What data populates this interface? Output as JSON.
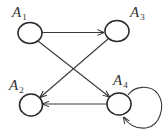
{
  "diagram": {
    "type": "directed-graph",
    "colors": {
      "stroke": "#2a2a2a",
      "background": "#ffffff"
    },
    "nodes": [
      {
        "id": "A1",
        "letter": "A",
        "sub": "1",
        "cx": 30,
        "cy": 33,
        "label_x": 12,
        "label_y": 5
      },
      {
        "id": "A3",
        "letter": "A",
        "sub": "3",
        "cx": 117,
        "cy": 31,
        "label_x": 130,
        "label_y": 5
      },
      {
        "id": "A2",
        "letter": "A",
        "sub": "2",
        "cx": 31,
        "cy": 105,
        "label_x": 9,
        "label_y": 78
      },
      {
        "id": "A4",
        "letter": "A",
        "sub": "4",
        "cx": 119,
        "cy": 104,
        "label_x": 113,
        "label_y": 73
      }
    ],
    "edges": [
      {
        "from": "A1",
        "to": "A3"
      },
      {
        "from": "A1",
        "to": "A4"
      },
      {
        "from": "A3",
        "to": "A2"
      },
      {
        "from": "A4",
        "to": "A2"
      },
      {
        "from": "A4",
        "to": "A4",
        "self_loop": true
      }
    ]
  }
}
